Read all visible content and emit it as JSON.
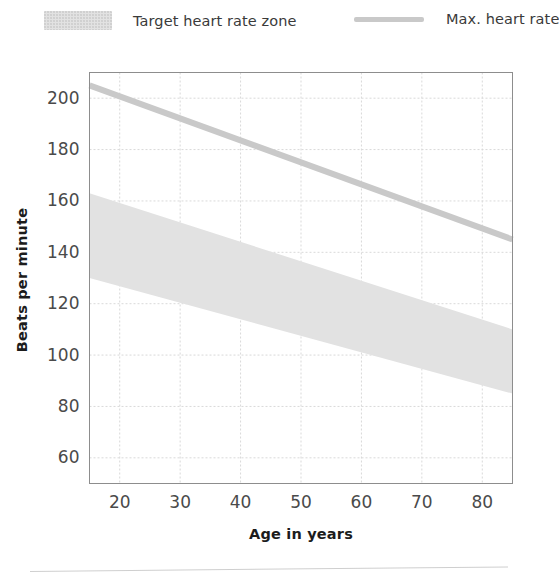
{
  "legend": {
    "position": "top",
    "items": [
      {
        "name": "target-zone",
        "label": "Target heart rate zone",
        "marker": "filled-box",
        "color": "#e2e2e2"
      },
      {
        "name": "max-heart-rate",
        "label": "Max. heart rate",
        "marker": "line",
        "color": "#c9c9c9"
      }
    ]
  },
  "axes": {
    "x_title": "Age in years",
    "y_title": "Beats per minute"
  },
  "chart_data": {
    "type": "area",
    "title": "",
    "subtitle": "",
    "xlabel": "Age in years",
    "ylabel": "Beats per minute",
    "xlim": [
      15,
      85
    ],
    "ylim": [
      50,
      210
    ],
    "xticks": [
      20,
      30,
      40,
      50,
      60,
      70,
      80
    ],
    "yticks": [
      60,
      80,
      100,
      120,
      140,
      160,
      180,
      200
    ],
    "xtick_labels": [
      "20",
      "30",
      "40",
      "50",
      "60",
      "70",
      "80"
    ],
    "ytick_labels": [
      "60",
      "80",
      "100",
      "120",
      "140",
      "160",
      "180",
      "200"
    ],
    "grid": true,
    "grid_style": "dotted",
    "grid_color": "#d9d9d9",
    "legend_position": "top",
    "series": [
      {
        "name": "Target heart rate zone",
        "type": "band",
        "color": "#e2e2e2",
        "x": [
          15,
          85
        ],
        "upper": [
          163,
          110
        ],
        "lower": [
          130,
          85
        ]
      },
      {
        "name": "Max. heart rate",
        "type": "line",
        "color": "#c9c9c9",
        "linewidth": 6,
        "x": [
          15,
          85
        ],
        "values": [
          205,
          145
        ]
      }
    ],
    "annotations": []
  }
}
